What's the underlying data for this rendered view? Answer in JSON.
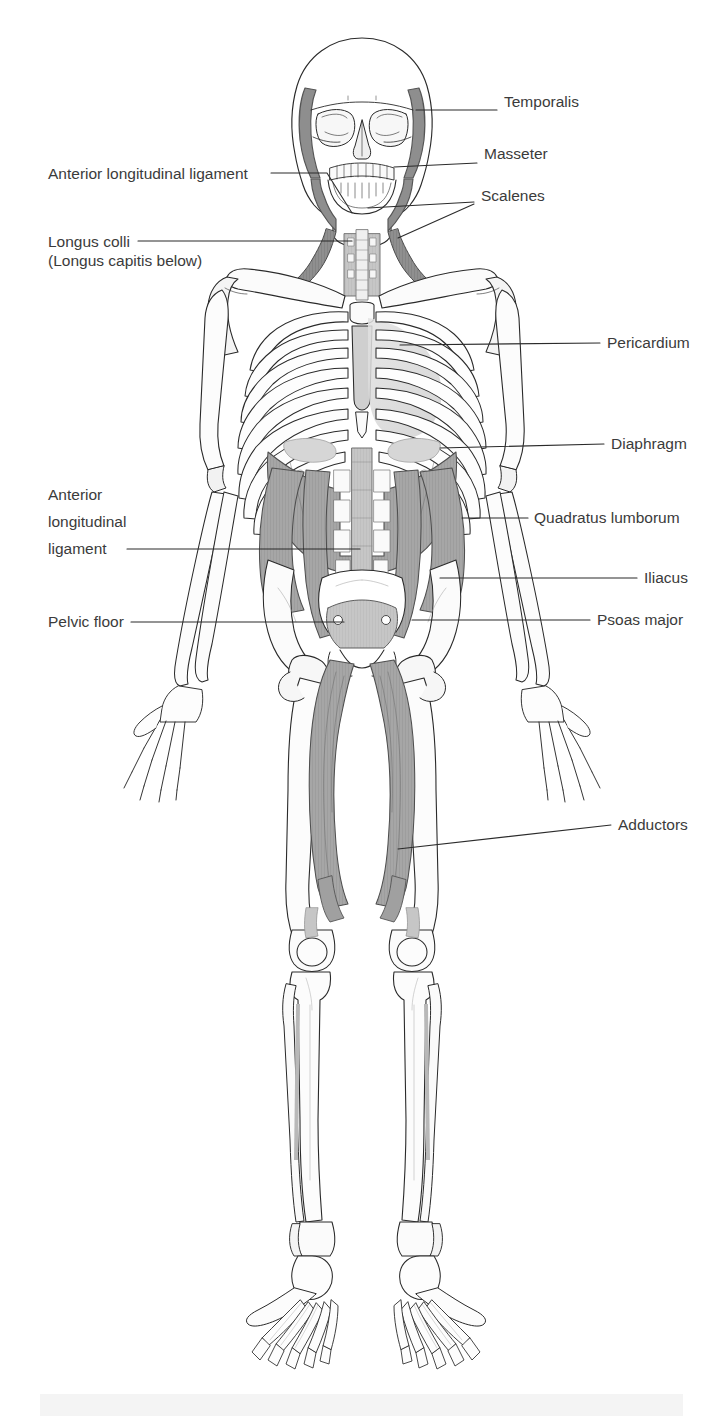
{
  "figure": {
    "view": "anterior",
    "colors": {
      "background": "#ffffff",
      "outline": "#2a2a2a",
      "bone_fill": "#ffffff",
      "bone_shade": "#e8e8e8",
      "muscle_dark": "#8c8c8c",
      "muscle_mid": "#a8a8a8",
      "muscle_light": "#c9c9c9",
      "muscle_pale": "#dcdcdc",
      "leader_line": "#2b2b2b",
      "label_text": "#3b3b3b",
      "bottom_band": "#f4f4f4"
    }
  },
  "labels": {
    "right": [
      {
        "id": "temporalis",
        "text": "Temporalis",
        "x": 504,
        "y": 102
      },
      {
        "id": "masseter",
        "text": "Masseter",
        "x": 484,
        "y": 154
      },
      {
        "id": "scalenes",
        "text": "Scalenes",
        "x": 481,
        "y": 196
      },
      {
        "id": "pericardium",
        "text": "Pericardium",
        "x": 607,
        "y": 335
      },
      {
        "id": "diaphragm",
        "text": "Diaphragm",
        "x": 611,
        "y": 436
      },
      {
        "id": "quadratus-lumborum",
        "text": "Quadratus lumborum",
        "x": 534,
        "y": 511
      },
      {
        "id": "iliacus",
        "text": "Iliacus",
        "x": 644,
        "y": 570
      },
      {
        "id": "psoas-major",
        "text": "Psoas major",
        "x": 597,
        "y": 612
      },
      {
        "id": "adductors",
        "text": "Adductors",
        "x": 618,
        "y": 817
      }
    ],
    "left": [
      {
        "id": "anterior-longitudinal-ligament-upper",
        "text": "Anterior longitudinal ligament",
        "x": 48,
        "y": 166
      },
      {
        "id": "longus-colli",
        "text": "Longus colli",
        "x": 48,
        "y": 234,
        "line2": "(Longus capitis below)",
        "y2": 253
      },
      {
        "id": "anterior-longitudinal-ligament-lower",
        "text": "Anterior",
        "x": 48,
        "y": 487,
        "line2": "longitudinal",
        "y2": 514,
        "line3": "ligament",
        "y3": 541
      },
      {
        "id": "pelvic-floor",
        "text": "Pelvic floor",
        "x": 48,
        "y": 614
      }
    ]
  },
  "structures": [
    {
      "id": "skull",
      "name": "Skull (cranium, orbits, maxilla, mandible, teeth)"
    },
    {
      "id": "temporalis-muscle",
      "name": "Temporalis muscle",
      "shade": "muscle_mid"
    },
    {
      "id": "masseter-muscle",
      "name": "Masseter muscle",
      "shade": "muscle_mid"
    },
    {
      "id": "cervical-spine",
      "name": "Cervical vertebrae"
    },
    {
      "id": "scalene-muscles",
      "name": "Scalene muscles",
      "shade": "muscle_dark"
    },
    {
      "id": "longus-colli-muscle",
      "name": "Longus colli / longus capitis",
      "shade": "muscle_light"
    },
    {
      "id": "clavicle",
      "name": "Clavicles"
    },
    {
      "id": "scapula",
      "name": "Scapulae"
    },
    {
      "id": "sternum",
      "name": "Sternum and manubrium"
    },
    {
      "id": "ribcage",
      "name": "Rib cage (12 pairs)"
    },
    {
      "id": "pericardium-region",
      "name": "Pericardium",
      "shade": "muscle_pale"
    },
    {
      "id": "diaphragm-muscle",
      "name": "Diaphragm",
      "shade": "muscle_mid"
    },
    {
      "id": "humerus",
      "name": "Humerus"
    },
    {
      "id": "radius-ulna",
      "name": "Radius and ulna"
    },
    {
      "id": "hand-bones",
      "name": "Carpals, metacarpals, phalanges"
    },
    {
      "id": "lumbar-spine",
      "name": "Lumbar vertebrae"
    },
    {
      "id": "quadratus-lumborum-muscle",
      "name": "Quadratus lumborum",
      "shade": "muscle_dark"
    },
    {
      "id": "psoas-major-muscle",
      "name": "Psoas major",
      "shade": "muscle_mid"
    },
    {
      "id": "iliacus-muscle",
      "name": "Iliacus",
      "shade": "muscle_mid"
    },
    {
      "id": "pelvis",
      "name": "Pelvis (ilium, ischium, pubis, sacrum)"
    },
    {
      "id": "pelvic-floor-muscles",
      "name": "Pelvic floor",
      "shade": "muscle_light"
    },
    {
      "id": "femur",
      "name": "Femurs"
    },
    {
      "id": "adductor-muscles",
      "name": "Adductor muscle group",
      "shade": "muscle_mid"
    },
    {
      "id": "patella",
      "name": "Patellae"
    },
    {
      "id": "tibia-fibula",
      "name": "Tibia and fibula"
    },
    {
      "id": "foot-bones",
      "name": "Tarsals, metatarsals, phalanges"
    }
  ]
}
